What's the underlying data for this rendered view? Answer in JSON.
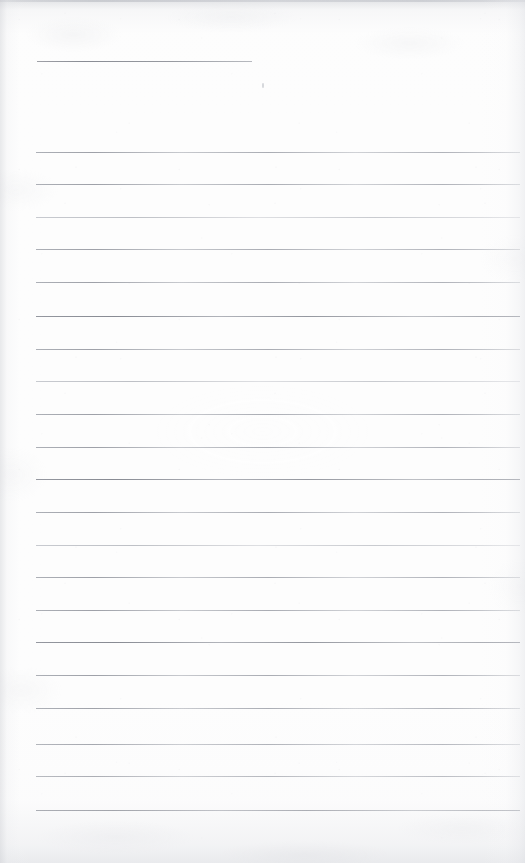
{
  "document": {
    "kind": "scanned-ruled-paper",
    "title": "Blank ruled notebook page",
    "description": "Scanned blank lined writing paper with a short header rule and 21 full-width ruled lines",
    "page_width": 525,
    "page_height": 863,
    "paper_color": "#fdfdfd",
    "rule_color": "#9fa2a9",
    "edge_shadow_color": "#cdcfd4",
    "body_text": ""
  },
  "header_rule": {
    "name": "header-rule",
    "x": 37,
    "y": 61,
    "width": 215,
    "weight": "medium"
  },
  "rules": [
    {
      "y": 152,
      "x": 36,
      "width": 484,
      "weight": "normal"
    },
    {
      "y": 184,
      "x": 36,
      "width": 484,
      "weight": "normal"
    },
    {
      "y": 217,
      "x": 36,
      "width": 484,
      "weight": "faint"
    },
    {
      "y": 249,
      "x": 36,
      "width": 484,
      "weight": "normal"
    },
    {
      "y": 282,
      "x": 36,
      "width": 484,
      "weight": "normal"
    },
    {
      "y": 316,
      "x": 36,
      "width": 484,
      "weight": "strong"
    },
    {
      "y": 349,
      "x": 36,
      "width": 484,
      "weight": "normal"
    },
    {
      "y": 381,
      "x": 36,
      "width": 484,
      "weight": "faint"
    },
    {
      "y": 414,
      "x": 36,
      "width": 484,
      "weight": "normal"
    },
    {
      "y": 447,
      "x": 36,
      "width": 484,
      "weight": "normal"
    },
    {
      "y": 479,
      "x": 36,
      "width": 484,
      "weight": "strong"
    },
    {
      "y": 512,
      "x": 36,
      "width": 484,
      "weight": "normal"
    },
    {
      "y": 545,
      "x": 36,
      "width": 484,
      "weight": "faint"
    },
    {
      "y": 577,
      "x": 36,
      "width": 484,
      "weight": "normal"
    },
    {
      "y": 610,
      "x": 36,
      "width": 484,
      "weight": "normal"
    },
    {
      "y": 642,
      "x": 36,
      "width": 484,
      "weight": "strong"
    },
    {
      "y": 675,
      "x": 36,
      "width": 484,
      "weight": "normal"
    },
    {
      "y": 708,
      "x": 36,
      "width": 484,
      "weight": "normal"
    },
    {
      "y": 744,
      "x": 36,
      "width": 484,
      "weight": "normal"
    },
    {
      "y": 776,
      "x": 36,
      "width": 484,
      "weight": "normal"
    },
    {
      "y": 810,
      "x": 36,
      "width": 484,
      "weight": "strong"
    }
  ],
  "artifacts": [
    {
      "name": "ink-speck",
      "x": 262,
      "y": 83,
      "width": 2,
      "height": 5
    }
  ]
}
